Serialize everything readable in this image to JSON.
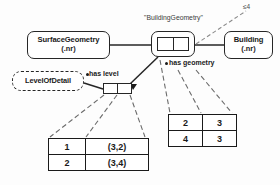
{
  "diagram": {
    "title_label": "\"BuildingGeometry\"",
    "cardinality_label": "≤4",
    "entities": {
      "surface_geometry": {
        "name": "SurfaceGeometry",
        "attribute": "(.nr)"
      },
      "building": {
        "name": "Building",
        "attribute": "(.nr)"
      },
      "level_of_detail": {
        "name": "LevelOfDetail",
        "attribute": ""
      }
    },
    "relationships": {
      "has_geometry": {
        "label": "has geometry"
      },
      "has_level": {
        "label": "has level"
      }
    },
    "tables": {
      "lod_instances": {
        "rows": [
          {
            "key": "1",
            "value": "(3,2)"
          },
          {
            "key": "2",
            "value": "(3,4)"
          }
        ]
      },
      "geometry_instances": {
        "rows": [
          {
            "c1": "2",
            "c2": "3"
          },
          {
            "c1": "4",
            "c2": "3"
          }
        ]
      }
    },
    "colors": {
      "stroke": "#262626",
      "text": "#1a1a1a",
      "background": "#fdfdfd"
    }
  }
}
